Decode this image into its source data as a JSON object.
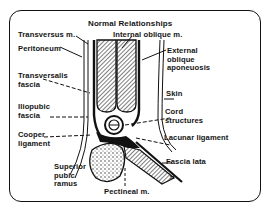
{
  "diagram": {
    "title": "Normal Relationships",
    "labels": {
      "transversus": "Transversus m.",
      "internal_oblique": "Internal oblique m.",
      "peritoneum": "Peritoneum",
      "external_oblique": "External\noblique\naponeuosis",
      "transversalis_fascia": "Transversalis\nfascia",
      "skin": "Skin",
      "iliopubic_fascia": "Iliopubic\nfascia",
      "cord_structures": "Cord\nstructures",
      "cooper_ligament": "Cooper\nligament",
      "lacunar_ligament": "Lacunar ligament",
      "superior_pubic_ramus": "Superior\npubic\nramus",
      "fascia_lata": "Fascia lata",
      "pectineal": "Pectineal m.",
      "symbol": "≈"
    },
    "colors": {
      "ink": "#141414",
      "background": "#ffffff"
    }
  }
}
